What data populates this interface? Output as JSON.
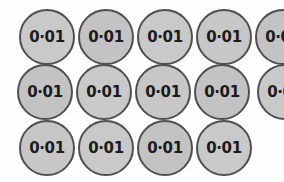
{
  "figure": {
    "kind": "coin-counter-array",
    "background_color": "#fefefe",
    "coin_fill_color": "#c6c6c6",
    "coin_border_color": "#4f4f4f",
    "label_color": "#1b1b1b",
    "total_count": 14,
    "coin_value_label": "0·01",
    "rows": [
      {
        "index": 0,
        "count": 5,
        "coins": [
          {
            "label": "0·01"
          },
          {
            "label": "0·01"
          },
          {
            "label": "0·01"
          },
          {
            "label": "0·01"
          },
          {
            "label": "0·01"
          }
        ]
      },
      {
        "index": 1,
        "count": 5,
        "coins": [
          {
            "label": "0·01"
          },
          {
            "label": "0·01"
          },
          {
            "label": "0·01"
          },
          {
            "label": "0·01"
          },
          {
            "label": "0·01"
          }
        ]
      },
      {
        "index": 2,
        "count": 4,
        "coins": [
          {
            "label": "0·01"
          },
          {
            "label": "0·01"
          },
          {
            "label": "0·01"
          },
          {
            "label": "0·01"
          }
        ]
      }
    ]
  }
}
